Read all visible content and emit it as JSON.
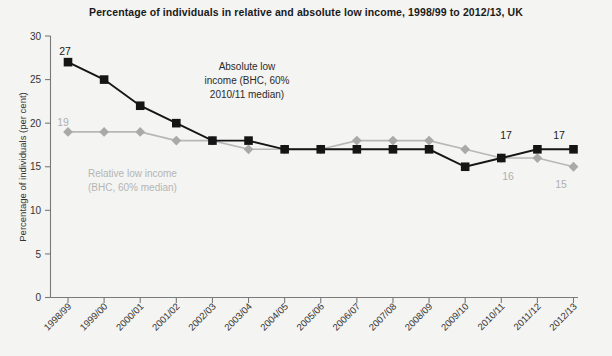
{
  "chart_data": {
    "type": "line",
    "title": "Percentage of individuals in relative and absolute low income, 1998/99 to 2012/13, UK",
    "xlabel": "",
    "ylabel": "Percentage of individuals (per cent)",
    "ylim": [
      0,
      30
    ],
    "yticks": [
      0,
      5,
      10,
      15,
      20,
      25,
      30
    ],
    "grid": false,
    "legend": "inline-annotations",
    "categories": [
      "1998/99",
      "1999/00",
      "2000/01",
      "2001/02",
      "2002/03",
      "2003/04",
      "2004/05",
      "2005/06",
      "2006/07",
      "2007/08",
      "2008/09",
      "2009/10",
      "2010/11",
      "2011/12",
      "2012/13"
    ],
    "series": [
      {
        "name": "Absolute low income (BHC, 60% 2010/11 median)",
        "color": "#151515",
        "marker": "square",
        "values": [
          27,
          25,
          22,
          20,
          18,
          18,
          17,
          17,
          17,
          17,
          17,
          15,
          16,
          17,
          17
        ]
      },
      {
        "name": "Relative low income (BHC, 60% median)",
        "color": "#a9a9a9",
        "marker": "diamond",
        "values": [
          19,
          19,
          19,
          18,
          18,
          17,
          17,
          17,
          18,
          18,
          18,
          17,
          16,
          16,
          15
        ]
      }
    ],
    "annotations": [
      {
        "id": "absolute-annotation",
        "lines": [
          "Absolute low",
          "income (BHC, 60%",
          "2010/11 median)"
        ]
      },
      {
        "id": "relative-annotation",
        "lines": [
          "Relative low income",
          "(BHC, 60% median)"
        ]
      }
    ],
    "data_labels": [
      {
        "id": "abs-first",
        "text": "27",
        "series": "absolute",
        "category": "1998/99"
      },
      {
        "id": "rel-first",
        "text": "19",
        "series": "relative",
        "category": "1999/00"
      },
      {
        "id": "abs-2011",
        "text": "17",
        "series": "absolute",
        "category": "2011/12"
      },
      {
        "id": "abs-2012",
        "text": "17",
        "series": "absolute",
        "category": "2012/13"
      },
      {
        "id": "rel-2011",
        "text": "16",
        "series": "relative",
        "category": "2011/12"
      },
      {
        "id": "rel-2012",
        "text": "15",
        "series": "relative",
        "category": "2012/13"
      }
    ]
  },
  "colors": {
    "background": "#f4f4f2",
    "absolute": "#151515",
    "relative": "#a9a9a9",
    "axis": "#7a7a7a",
    "text": "#333333"
  }
}
